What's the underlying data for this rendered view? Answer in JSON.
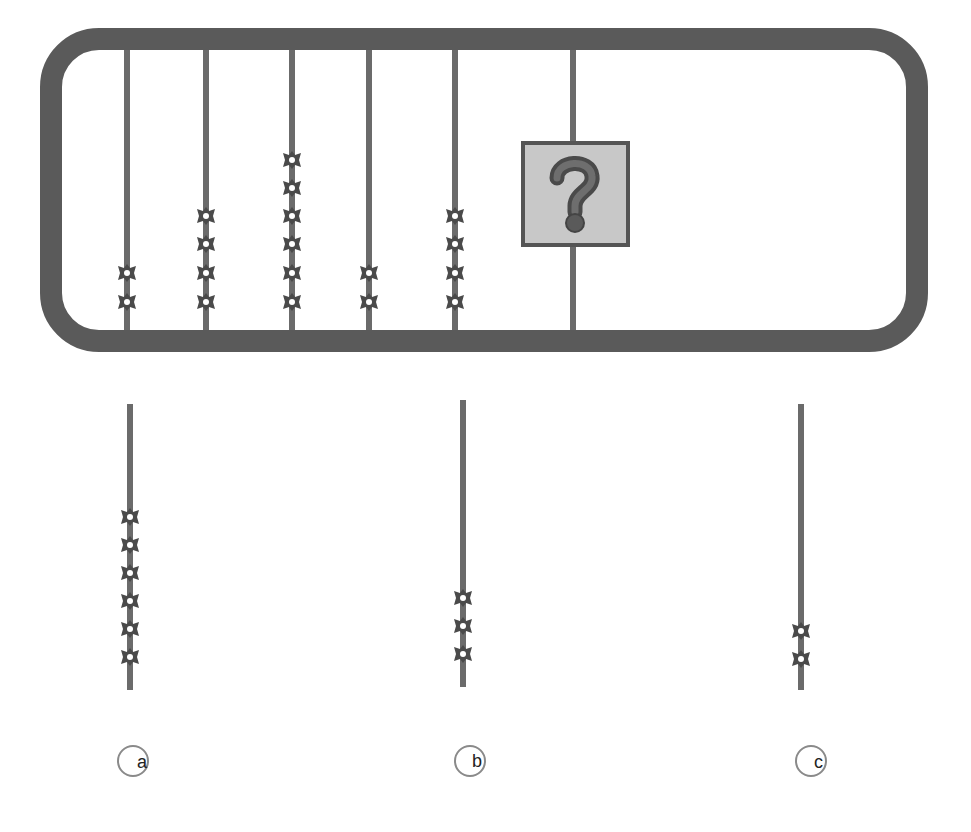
{
  "puzzle": {
    "type": "abacus-sequence",
    "colors": {
      "frame": "#5a5a5a",
      "rod": "#6b6b6b",
      "bead": "#4a4a4a",
      "question_box_fill": "#c8c8c8",
      "question_box_border": "#555555",
      "question_mark": "#5a5a5a"
    },
    "frame_rods": [
      {
        "index": 1,
        "beads": 2
      },
      {
        "index": 2,
        "beads": 4
      },
      {
        "index": 3,
        "beads": 6
      },
      {
        "index": 4,
        "beads": 2
      },
      {
        "index": 5,
        "beads": 4
      },
      {
        "index": 6,
        "beads": null,
        "hidden_by": "question-mark"
      }
    ],
    "question_symbol": "?",
    "options": [
      {
        "label": "a",
        "beads": 6
      },
      {
        "label": "b",
        "beads": 3
      },
      {
        "label": "c",
        "beads": 2
      }
    ]
  }
}
